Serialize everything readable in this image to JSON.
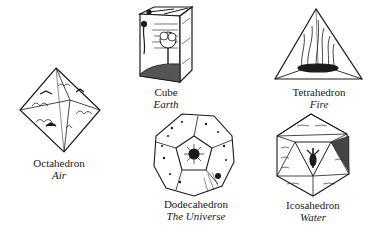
{
  "figure": {
    "background": "#ffffff",
    "ink": "#1a1a1a",
    "solids": [
      {
        "name": "Cube",
        "element": "Earth"
      },
      {
        "name": "Tetrahedron",
        "element": "Fire"
      },
      {
        "name": "Octahedron",
        "element": "Air"
      },
      {
        "name": "Dodecahedron",
        "element": "The Universe"
      },
      {
        "name": "Icosahedron",
        "element": "Water"
      }
    ]
  }
}
